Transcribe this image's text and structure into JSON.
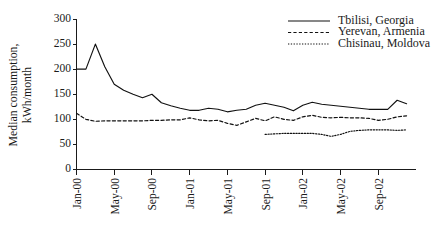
{
  "chart_data": {
    "type": "line",
    "title": "",
    "xlabel": "",
    "ylabel": "Median consumption, kWh/month",
    "ylabel_line1": "Median consumption,",
    "ylabel_line2": "kWh/month",
    "ylim": [
      0,
      300
    ],
    "y_ticks": [
      0,
      50,
      100,
      150,
      200,
      250,
      300
    ],
    "y_tick_labels": [
      "0",
      "50",
      "100",
      "150",
      "200",
      "250",
      "300"
    ],
    "x_tick_labels": [
      "Jan-00",
      "May-00",
      "Sep-00",
      "Jan-01",
      "May-01",
      "Sep-01",
      "Jan-02",
      "May-02",
      "Sep-02"
    ],
    "x_tick_months": [
      0,
      4,
      8,
      12,
      16,
      20,
      24,
      28,
      32
    ],
    "x_range_months": [
      0,
      36
    ],
    "grid": false,
    "legend_position": "top-right",
    "x_months": [
      "Jan-00",
      "Feb-00",
      "Mar-00",
      "Apr-00",
      "May-00",
      "Jun-00",
      "Jul-00",
      "Aug-00",
      "Sep-00",
      "Oct-00",
      "Nov-00",
      "Dec-00",
      "Jan-01",
      "Feb-01",
      "Mar-01",
      "Apr-01",
      "May-01",
      "Jun-01",
      "Jul-01",
      "Aug-01",
      "Sep-01",
      "Oct-01",
      "Nov-01",
      "Dec-01",
      "Jan-02",
      "Feb-02",
      "Mar-02",
      "Apr-02",
      "May-02",
      "Jun-02",
      "Jul-02",
      "Aug-02",
      "Sep-02",
      "Oct-02",
      "Nov-02",
      "Dec-02"
    ],
    "series": [
      {
        "name": "Tbilisi, Georgia",
        "style": "solid",
        "color": "#111111",
        "start_month_index": 0,
        "values": [
          200,
          200,
          250,
          205,
          170,
          158,
          150,
          143,
          150,
          133,
          127,
          122,
          118,
          118,
          122,
          120,
          115,
          118,
          120,
          128,
          132,
          128,
          124,
          117,
          128,
          134,
          130,
          128,
          126,
          124,
          122,
          120,
          120,
          120,
          138,
          131
        ]
      },
      {
        "name": "Yerevan, Armenia",
        "style": "dashed",
        "color": "#111111",
        "start_month_index": 0,
        "values": [
          112,
          100,
          96,
          97,
          97,
          97,
          97,
          97,
          98,
          98,
          99,
          99,
          103,
          99,
          97,
          98,
          92,
          88,
          95,
          102,
          97,
          105,
          100,
          98,
          105,
          108,
          104,
          103,
          104,
          103,
          103,
          102,
          98,
          100,
          105,
          107
        ]
      },
      {
        "name": "Chisinau, Moldova",
        "style": "dotted",
        "color": "#111111",
        "start_month_index": 20,
        "values": [
          70,
          71,
          72,
          72,
          72,
          72,
          70,
          66,
          70,
          76,
          78,
          79,
          79,
          79,
          78,
          79
        ]
      }
    ]
  },
  "legend": {
    "items": [
      {
        "label": "Tbilisi, Georgia",
        "style": "solid"
      },
      {
        "label": "Yerevan, Armenia",
        "style": "dashed"
      },
      {
        "label": "Chisinau, Moldova",
        "style": "dotted"
      }
    ]
  }
}
